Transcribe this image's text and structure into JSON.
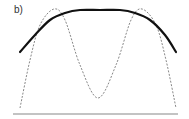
{
  "figure": {
    "panel_label": "b)",
    "colors": {
      "solid_curve": "#111111",
      "dashed_curve": "#888888",
      "baseline": "#888888",
      "background": "#ffffff"
    },
    "curves": [
      {
        "name": "solid-plateau-curve",
        "style": "solid",
        "description": "Broad flat-topped (super-Gaussian) curve",
        "points": [
          [
            20,
            52
          ],
          [
            35,
            35
          ],
          [
            50,
            20
          ],
          [
            65,
            13
          ],
          [
            80,
            10
          ],
          [
            100,
            10
          ],
          [
            120,
            10
          ],
          [
            135,
            13
          ],
          [
            150,
            20
          ],
          [
            165,
            35
          ],
          [
            176,
            52
          ]
        ]
      },
      {
        "name": "dashed-double-peak-curve",
        "style": "dashed",
        "description": "Double-peaked curve with central minimum",
        "points": [
          [
            20,
            108
          ],
          [
            30,
            60
          ],
          [
            40,
            25
          ],
          [
            54,
            9
          ],
          [
            65,
            20
          ],
          [
            80,
            65
          ],
          [
            98,
            98
          ],
          [
            116,
            65
          ],
          [
            131,
            20
          ],
          [
            142,
            9
          ],
          [
            156,
            25
          ],
          [
            166,
            60
          ],
          [
            176,
            108
          ]
        ]
      }
    ],
    "baseline": {
      "x1": 13,
      "x2": 178,
      "y": 114
    }
  }
}
